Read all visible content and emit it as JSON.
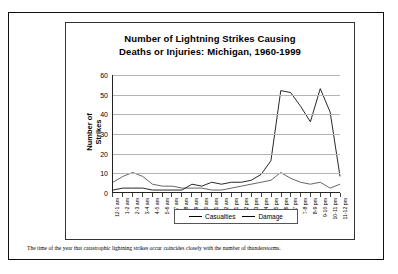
{
  "page": {
    "caption": "The time of the year that catastrophic lightning strikes occur coincides closely with the number of thunderstorms."
  },
  "legend": {
    "casualties_label": "Casualties",
    "damage_label": "Damage"
  },
  "colors": {
    "casualties": "#555555",
    "damage": "#111111",
    "grid": "#b4b4b4",
    "axis": "#222222",
    "border": "#111111"
  },
  "chart_data": {
    "type": "line",
    "title": "Number of Lightning Strikes Causing Deaths or Injuries: Michigan, 1960-1999",
    "title_line1": "Number of Lightning Strikes Causing",
    "title_line2": "Deaths or Injuries: Michigan, 1960-1999",
    "xlabel": "",
    "ylabel": "Number of Strikes",
    "ylim": [
      0,
      60
    ],
    "yticks": [
      0,
      10,
      20,
      30,
      40,
      50,
      60
    ],
    "grid": true,
    "legend_position": "bottom",
    "categories": [
      "12-1 am",
      "1-2 am",
      "2-3 am",
      "3-4 am",
      "4-5 am",
      "5-6 am",
      "6-7 am",
      "7-8 am",
      "8-9 am",
      "9-10 am",
      "10-11 am",
      "11-12 am",
      "12-1 pm",
      "1-2 pm",
      "2-3 pm",
      "3-4 pm",
      "4-5 pm",
      "5-6 pm",
      "6-7 pm",
      "7-8 pm",
      "8-9 pm",
      "9-10 pm",
      "10-11 pm",
      "11-12 pm"
    ],
    "series": [
      {
        "name": "Casualties",
        "values": [
          5,
          8,
          10,
          8,
          4,
          3,
          3,
          2,
          2,
          2,
          1,
          1,
          2,
          3,
          4,
          5,
          6,
          10,
          7,
          5,
          4,
          5,
          2,
          4
        ]
      },
      {
        "name": "Damage",
        "values": [
          1,
          2,
          2,
          2,
          1,
          1,
          1,
          1,
          4,
          3,
          5,
          4,
          5,
          5,
          6,
          9,
          16,
          52,
          51,
          44,
          36,
          53,
          41,
          8
        ]
      }
    ]
  }
}
